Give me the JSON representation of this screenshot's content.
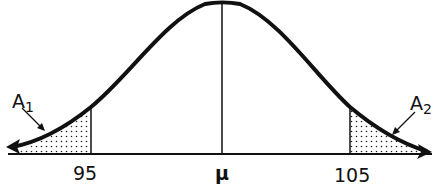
{
  "diagram": {
    "type": "normal-distribution-curve",
    "center_label": "μ",
    "left_bound_label": "95",
    "right_bound_label": "105",
    "left_area_label": {
      "base": "A",
      "sub": "1"
    },
    "right_area_label": {
      "base": "A",
      "sub": "2"
    },
    "shaded_regions": [
      "left tail below 95 (A1)",
      "right tail above 105 (A2)"
    ],
    "colors": {
      "ink": "#111111",
      "background": "#ffffff"
    }
  }
}
